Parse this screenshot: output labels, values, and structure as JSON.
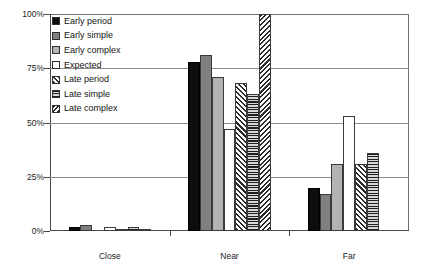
{
  "chart_data": {
    "type": "bar",
    "title": "",
    "xlabel": "",
    "ylabel": "",
    "ylim": [
      0,
      100
    ],
    "ytick_labels": [
      "100%",
      "75%",
      "50%",
      "25%",
      "0%"
    ],
    "ytick_values": [
      100,
      75,
      50,
      25,
      0
    ],
    "grid": true,
    "legend_position": "upper-left-inside",
    "categories": [
      "Close",
      "Near",
      "Far"
    ],
    "series": [
      {
        "name": "Early period",
        "pattern": "solid-black",
        "values": [
          2,
          78,
          20
        ]
      },
      {
        "name": "Early simple",
        "pattern": "mid-gray",
        "values": [
          3,
          81,
          17
        ]
      },
      {
        "name": "Early complex",
        "pattern": "light-gray",
        "values": [
          0,
          71,
          31
        ]
      },
      {
        "name": "Expected",
        "pattern": "white",
        "values": [
          2,
          47,
          53
        ]
      },
      {
        "name": "Late period",
        "pattern": "diag-hatch",
        "values": [
          1,
          68,
          31
        ]
      },
      {
        "name": "Late simple",
        "pattern": "horiz-lines",
        "values": [
          2,
          63,
          36
        ]
      },
      {
        "name": "Late complex",
        "pattern": "diag-cross",
        "values": [
          1,
          100,
          0
        ]
      }
    ]
  },
  "legend": {
    "items": [
      {
        "label": "Early period",
        "pattern": "solid-black"
      },
      {
        "label": "Early simple",
        "pattern": "mid-gray"
      },
      {
        "label": "Early complex",
        "pattern": "light-gray"
      },
      {
        "label": "Expected",
        "pattern": "white"
      },
      {
        "label": "Late period",
        "pattern": "diag-hatch"
      },
      {
        "label": "Late simple",
        "pattern": "horiz-lines"
      },
      {
        "label": "Late complex",
        "pattern": "diag-cross"
      }
    ]
  },
  "axes": {
    "y_labels": [
      "100%",
      "75%",
      "50%",
      "25%",
      "0%"
    ],
    "x_labels": [
      "Close",
      "Near",
      "Far"
    ]
  }
}
